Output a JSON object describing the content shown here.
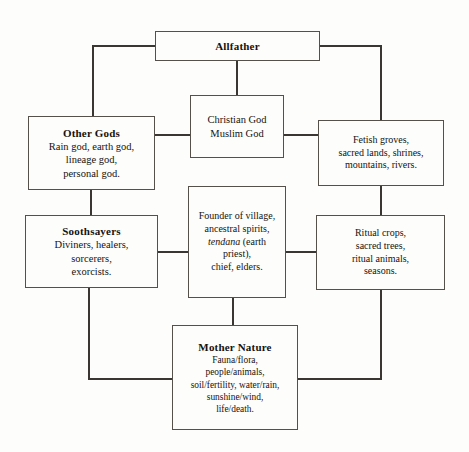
{
  "diagram": {
    "type": "hierarchy-flow-chart",
    "background_color": "#fdfdfb",
    "line_color": "#3a3631",
    "box_border_color": "#56504a",
    "text_color": "#16120f",
    "nodes": [
      {
        "id": "allfather",
        "title": "Allfather",
        "body": "",
        "x": 155,
        "y": 31,
        "w": 165,
        "h": 30
      },
      {
        "id": "abrahamic-gods",
        "title": "",
        "body": "Christian God\nMuslim God",
        "x": 190,
        "y": 95,
        "w": 94,
        "h": 63
      },
      {
        "id": "other-gods",
        "title": "Other Gods",
        "body": "Rain god, earth god,\nlineage god,\npersonal god.",
        "x": 28,
        "y": 116,
        "w": 127,
        "h": 74
      },
      {
        "id": "fetish-groves",
        "title": "",
        "body": "Fetish groves,\nsacred lands, shrines,\nmountains, rivers.",
        "x": 318,
        "y": 120,
        "w": 126,
        "h": 66
      },
      {
        "id": "soothsayers",
        "title": "Soothsayers",
        "body": "Diviners, healers,\nsorcerers,\nexorcists.",
        "x": 25,
        "y": 215,
        "w": 133,
        "h": 73
      },
      {
        "id": "founder-of-village",
        "title": "",
        "body_pre": "Founder of village,\nancestral spirits,\n",
        "body_italic": "tendana",
        "body_post": " (earth\npriest),\nchief, elders.",
        "x": 188,
        "y": 186,
        "w": 98,
        "h": 112
      },
      {
        "id": "ritual-crops",
        "title": "",
        "body": "Ritual crops,\nsacred trees,\nritual animals,\nseasons.",
        "x": 316,
        "y": 215,
        "w": 129,
        "h": 75
      },
      {
        "id": "mother-nature",
        "title": "Mother Nature",
        "body": "Fauna/flora,\npeople/animals,\nsoil/fertility, water/rain,\nsunshine/wind,\nlife/death.",
        "x": 172,
        "y": 325,
        "w": 126,
        "h": 105
      }
    ],
    "connectors": [
      {
        "id": "allfather-to-abrahamic",
        "orientation": "vertical",
        "x": 236,
        "y": 61,
        "len": 34
      },
      {
        "id": "allfather-left-arm",
        "orientation": "horizontal",
        "x": 92,
        "y": 46,
        "len": 63
      },
      {
        "id": "allfather-left-down",
        "orientation": "vertical",
        "x": 92,
        "y": 46,
        "len": 70
      },
      {
        "id": "allfather-right-arm",
        "orientation": "horizontal",
        "x": 320,
        "y": 46,
        "len": 61
      },
      {
        "id": "allfather-right-down",
        "orientation": "vertical",
        "x": 380,
        "y": 46,
        "len": 74
      },
      {
        "id": "other-gods-to-abrahamic",
        "orientation": "horizontal",
        "x": 155,
        "y": 135,
        "len": 35
      },
      {
        "id": "abrahamic-to-fetish",
        "orientation": "horizontal",
        "x": 284,
        "y": 135,
        "len": 34
      },
      {
        "id": "other-gods-to-soothsayers",
        "orientation": "vertical",
        "x": 91,
        "y": 190,
        "len": 25
      },
      {
        "id": "fetish-to-ritual-crops",
        "orientation": "vertical",
        "x": 380,
        "y": 186,
        "len": 29
      },
      {
        "id": "soothsayers-to-founder",
        "orientation": "horizontal",
        "x": 158,
        "y": 252,
        "len": 30
      },
      {
        "id": "founder-to-ritual-crops",
        "orientation": "horizontal",
        "x": 286,
        "y": 252,
        "len": 30
      },
      {
        "id": "founder-to-mother-nature",
        "orientation": "vertical",
        "x": 232,
        "y": 298,
        "len": 27
      },
      {
        "id": "soothsayers-down",
        "orientation": "vertical",
        "x": 88,
        "y": 288,
        "len": 92
      },
      {
        "id": "soothsayers-to-mother-left",
        "orientation": "horizontal",
        "x": 88,
        "y": 379,
        "len": 84
      },
      {
        "id": "ritual-crops-down",
        "orientation": "vertical",
        "x": 380,
        "y": 290,
        "len": 90
      },
      {
        "id": "ritual-to-mother-right",
        "orientation": "horizontal",
        "x": 298,
        "y": 379,
        "len": 83
      }
    ]
  }
}
